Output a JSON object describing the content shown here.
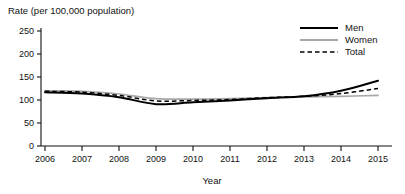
{
  "figure": {
    "width": 405,
    "height": 194,
    "background_color": "#ffffff"
  },
  "chart_data": {
    "type": "line",
    "title": "",
    "ylabel": "Rate (per 100,000 population)",
    "xlabel": "Year",
    "x": [
      2006,
      2007,
      2008,
      2009,
      2010,
      2011,
      2012,
      2013,
      2014,
      2015
    ],
    "categories": [
      "2006",
      "2007",
      "2008",
      "2009",
      "2010",
      "2011",
      "2012",
      "2013",
      "2014",
      "2015"
    ],
    "series": [
      {
        "name": "Men",
        "color": "#000000",
        "style": "solid",
        "values": [
          117,
          114,
          106,
          91,
          95,
          99,
          104,
          108,
          120,
          142
        ]
      },
      {
        "name": "Women",
        "color": "#a8a8a8",
        "style": "solid",
        "values": [
          120,
          119,
          113,
          103,
          102,
          103,
          105,
          107,
          108,
          110
        ]
      },
      {
        "name": "Total",
        "color": "#000000",
        "style": "dashed",
        "values": [
          119,
          117,
          110,
          98,
          99,
          101,
          105,
          108,
          114,
          125
        ]
      }
    ],
    "ylim": [
      0,
      265
    ],
    "yticks": [
      0,
      50,
      100,
      150,
      200,
      250
    ],
    "ytick_labels": [
      "0",
      "50",
      "100",
      "150",
      "200",
      "250"
    ],
    "xlim": [
      2006,
      2015
    ],
    "xticks": [
      2006,
      2007,
      2008,
      2009,
      2010,
      2011,
      2012,
      2013,
      2014,
      2015
    ],
    "grid": false,
    "legend_position": "top-right",
    "legend_entries": [
      "Men",
      "Women",
      "Total"
    ]
  }
}
